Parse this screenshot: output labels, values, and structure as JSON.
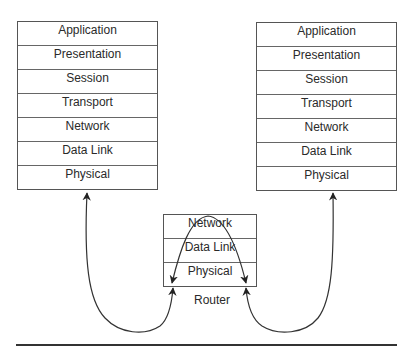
{
  "left_host": {
    "layers": [
      "Application",
      "Presentation",
      "Session",
      "Transport",
      "Network",
      "Data Link",
      "Physical"
    ]
  },
  "right_host": {
    "layers": [
      "Application",
      "Presentation",
      "Session",
      "Transport",
      "Network",
      "Data Link",
      "Physical"
    ]
  },
  "router": {
    "label": "Router",
    "layers": [
      "Network",
      "Data Link",
      "Physical"
    ]
  },
  "colors": {
    "line": "#333333",
    "box_border": "#555555",
    "text": "#2a2a2a"
  }
}
